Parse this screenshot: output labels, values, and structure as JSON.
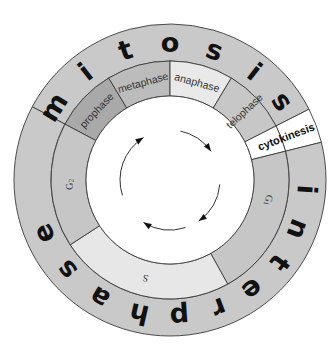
{
  "geometry": {
    "cx": 170,
    "cy": 180,
    "r_inner": 84,
    "r_middle": 119,
    "r_outer": 156
  },
  "colors": {
    "outer_ring": "#c9c9c9",
    "prophase": "#a9a9a9",
    "metaphase": "#bcbcbc",
    "anaphase": "#e9e9e9",
    "telophase": "#c7c7c7",
    "cytokinesis": "#ffffff",
    "G1": "#c6c6c6",
    "S": "#e7e7e7",
    "G2": "#c6c6c6",
    "center": "#ffffff",
    "stroke": "#3a3a3a"
  },
  "outer_ring": {
    "mitosis": {
      "label": "mitosis",
      "start": -152,
      "end": -27,
      "letters": [
        {
          "ch": "m",
          "angle": -148
        },
        {
          "ch": "i",
          "angle": -128
        },
        {
          "ch": "t",
          "angle": -109
        },
        {
          "ch": "o",
          "angle": -90
        },
        {
          "ch": "s",
          "angle": -71
        },
        {
          "ch": "i",
          "angle": -52
        },
        {
          "ch": "s",
          "angle": -35
        }
      ]
    },
    "cytokinesis": {
      "start": -27,
      "end": -14
    },
    "interphase": {
      "label": "interphase",
      "start": -14,
      "end": 208,
      "letters": [
        {
          "ch": "i",
          "angle": 4
        },
        {
          "ch": "n",
          "angle": 21
        },
        {
          "ch": "t",
          "angle": 37
        },
        {
          "ch": "e",
          "angle": 53
        },
        {
          "ch": "r",
          "angle": 69
        },
        {
          "ch": "p",
          "angle": 86
        },
        {
          "ch": "h",
          "angle": 103
        },
        {
          "ch": "a",
          "angle": 121
        },
        {
          "ch": "s",
          "angle": 139
        },
        {
          "ch": "e",
          "angle": 157
        }
      ]
    }
  },
  "middle_ring": [
    {
      "name": "prophase",
      "label": "prophase",
      "start": -152,
      "end": -121
    },
    {
      "name": "metaphase",
      "label": "metaphase",
      "start": -121,
      "end": -90
    },
    {
      "name": "anaphase",
      "label": "anaphase",
      "start": -90,
      "end": -59
    },
    {
      "name": "telophase",
      "label": "telophase",
      "start": -59,
      "end": -27
    },
    {
      "name": "cytokinesis",
      "label": "cytokinesis",
      "start": -27,
      "end": -14
    },
    {
      "name": "G1",
      "label": "G1",
      "start": -14,
      "end": 61
    },
    {
      "name": "S",
      "label": "S",
      "start": 61,
      "end": 147
    },
    {
      "name": "G2",
      "label": "G2",
      "start": 147,
      "end": 208
    }
  ],
  "labels": {
    "mitosis_word": "mitosis",
    "interphase_word": "interphase",
    "prophase": "prophase",
    "metaphase": "metaphase",
    "anaphase": "anaphase",
    "telophase": "telophase",
    "cytokinesis": "cytokinesis",
    "g1_main": "G",
    "g1_sub": "1",
    "s": "S",
    "g2_main": "G",
    "g2_sub": "2"
  },
  "cycle_arrows": {
    "direction": "clockwise",
    "count": 4,
    "radius": 50,
    "arcs": [
      {
        "start": -78,
        "end": -35
      },
      {
        "start": 5,
        "end": 55
      },
      {
        "start": 72,
        "end": 122
      },
      {
        "start": 162,
        "end": 238
      }
    ]
  }
}
